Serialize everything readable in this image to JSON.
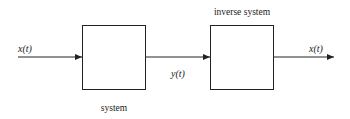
{
  "diagram": {
    "input_label": "x(t)",
    "intermediate_label": "y(t)",
    "output_label": "x(t)",
    "blocks": [
      {
        "id": "system",
        "label": "system",
        "label_position": "below"
      },
      {
        "id": "inverse-system",
        "label": "inverse system",
        "label_position": "above"
      }
    ],
    "edges": [
      {
        "from": "input",
        "to": "system",
        "label": "x(t)"
      },
      {
        "from": "system",
        "to": "inverse-system",
        "label": "y(t)"
      },
      {
        "from": "inverse-system",
        "to": "output",
        "label": "x(t)"
      }
    ],
    "colors": {
      "line": "#222222",
      "background": "#ffffff"
    }
  }
}
